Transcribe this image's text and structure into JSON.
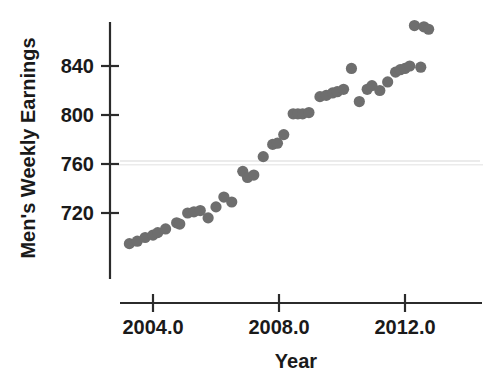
{
  "chart_data": {
    "type": "scatter",
    "title": "",
    "xlabel": "Year",
    "ylabel": "Men's Weekly Earnings",
    "xlim": [
      2003.0,
      2013.6
    ],
    "ylim": [
      688,
      882
    ],
    "xticks": [
      2004.0,
      2008.0,
      2012.0
    ],
    "xtick_labels": [
      "2004.0",
      "2008.0",
      "2012.0"
    ],
    "yticks": [
      720,
      760,
      800,
      840
    ],
    "ytick_labels": [
      "720",
      "760",
      "800",
      "840"
    ],
    "grid": false,
    "legend": null,
    "marker_color": "#6e6e6e",
    "marker_size": 10,
    "axis_color": "#2b2b2b",
    "x": [
      2003.25,
      2003.5,
      2003.75,
      2004.0,
      2004.25,
      2004.5,
      2004.75,
      2005.0,
      2005.25,
      2005.5,
      2005.75,
      2006.0,
      2006.25,
      2006.5,
      2006.75,
      2007.0,
      2007.25,
      2007.5,
      2007.75,
      2008.0,
      2008.25,
      2008.5,
      2008.75,
      2009.0,
      2009.25,
      2009.5,
      2009.75,
      2010.0,
      2010.25,
      2010.5,
      2010.75,
      2011.0,
      2011.25,
      2011.5,
      2011.75,
      2012.0,
      2012.25,
      2012.5,
      2012.75,
      2013.0,
      2013.25
    ],
    "y": [
      695,
      697,
      700,
      702,
      704,
      707,
      712,
      712,
      720,
      721,
      722,
      716,
      725,
      733,
      729,
      754,
      749,
      751,
      766,
      776,
      777,
      784,
      801,
      801,
      802,
      804,
      813,
      815,
      816,
      821,
      838,
      811,
      821,
      824,
      820,
      827,
      835,
      838,
      840,
      842,
      839
    ],
    "x_extra": [
      2012.25,
      2012.5,
      2012.75,
      2013.0
    ],
    "y_extra": [
      873,
      872,
      870,
      839
    ],
    "points": [
      {
        "x": 2003.25,
        "y": 695
      },
      {
        "x": 2003.5,
        "y": 697
      },
      {
        "x": 2003.75,
        "y": 700
      },
      {
        "x": 2004.0,
        "y": 702
      },
      {
        "x": 2004.15,
        "y": 704
      },
      {
        "x": 2004.4,
        "y": 707
      },
      {
        "x": 2004.75,
        "y": 712
      },
      {
        "x": 2004.85,
        "y": 711
      },
      {
        "x": 2005.1,
        "y": 720
      },
      {
        "x": 2005.3,
        "y": 721
      },
      {
        "x": 2005.5,
        "y": 722
      },
      {
        "x": 2005.75,
        "y": 716
      },
      {
        "x": 2006.0,
        "y": 725
      },
      {
        "x": 2006.25,
        "y": 733
      },
      {
        "x": 2006.5,
        "y": 729
      },
      {
        "x": 2006.85,
        "y": 754
      },
      {
        "x": 2007.0,
        "y": 749
      },
      {
        "x": 2007.2,
        "y": 751
      },
      {
        "x": 2007.5,
        "y": 766
      },
      {
        "x": 2007.8,
        "y": 776
      },
      {
        "x": 2007.95,
        "y": 777
      },
      {
        "x": 2008.15,
        "y": 784
      },
      {
        "x": 2008.45,
        "y": 801
      },
      {
        "x": 2008.6,
        "y": 801
      },
      {
        "x": 2008.75,
        "y": 801
      },
      {
        "x": 2008.95,
        "y": 802
      },
      {
        "x": 2009.3,
        "y": 815
      },
      {
        "x": 2009.5,
        "y": 816
      },
      {
        "x": 2009.7,
        "y": 818
      },
      {
        "x": 2009.85,
        "y": 819
      },
      {
        "x": 2010.05,
        "y": 821
      },
      {
        "x": 2010.3,
        "y": 838
      },
      {
        "x": 2010.55,
        "y": 811
      },
      {
        "x": 2010.8,
        "y": 821
      },
      {
        "x": 2010.95,
        "y": 824
      },
      {
        "x": 2011.2,
        "y": 820
      },
      {
        "x": 2011.45,
        "y": 827
      },
      {
        "x": 2011.7,
        "y": 835
      },
      {
        "x": 2011.85,
        "y": 837
      },
      {
        "x": 2012.0,
        "y": 838
      },
      {
        "x": 2012.15,
        "y": 840
      },
      {
        "x": 2012.3,
        "y": 873
      },
      {
        "x": 2012.6,
        "y": 872
      },
      {
        "x": 2012.75,
        "y": 870
      },
      {
        "x": 2012.5,
        "y": 839
      }
    ]
  },
  "axes": {
    "y_title": "Men's Weekly Earnings",
    "x_title": "Year",
    "y_tick_0": "720",
    "y_tick_1": "760",
    "y_tick_2": "800",
    "y_tick_3": "840",
    "x_tick_0": "2004.0",
    "x_tick_1": "2008.0",
    "x_tick_2": "2012.0"
  }
}
